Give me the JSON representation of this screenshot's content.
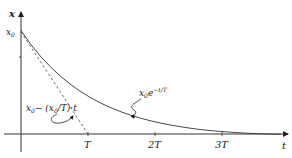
{
  "diagram": {
    "y_axis_label": "x",
    "x_axis_label": "t",
    "y_intercept_label": "x",
    "y_intercept_sub": "0",
    "ticks": [
      {
        "label": "T",
        "x": 88
      },
      {
        "label": "2T",
        "x": 155
      },
      {
        "label": "3T",
        "x": 222
      }
    ],
    "curve_label": {
      "base": "x",
      "sub": "0",
      "e": "e",
      "exp": "−t/T"
    },
    "tangent_label": {
      "part1": "x",
      "sub1": "0",
      "part2": "− (x",
      "sub2": "0",
      "part3": "/T)·t"
    },
    "colors": {
      "curve": "#333333",
      "axis": "#333333",
      "tangent": "#555555"
    }
  }
}
